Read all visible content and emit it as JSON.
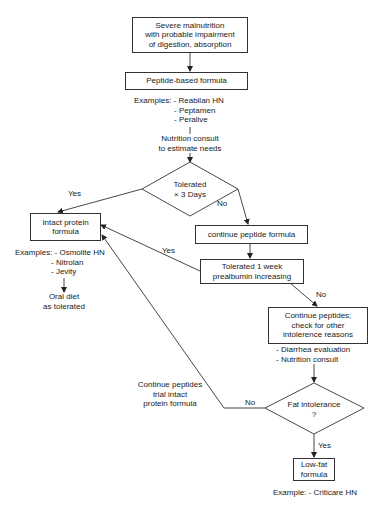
{
  "diagram": {
    "type": "flowchart",
    "nodes": {
      "start": {
        "lines": [
          "Severe malnutrition",
          "with probable impairment",
          "of digestion, absorption"
        ]
      },
      "peptide_formula": {
        "label": "Peptide-based formula"
      },
      "peptide_examples": {
        "lines": [
          "Examples: - Reabilan HN",
          "- Peptamen",
          "- Peralive"
        ]
      },
      "nutrition_consult": {
        "lines": [
          "Nutrition consult",
          "to estimate needs"
        ]
      },
      "decision_tolerated_3days": {
        "lines": [
          "Tolerated",
          "× 3 Days"
        ]
      },
      "intact_protein": {
        "lines": [
          "Intact protein",
          "formula"
        ]
      },
      "intact_examples": {
        "lines": [
          "Examples: - Osmolite HN",
          "- Nitrolan",
          "- Jevity"
        ]
      },
      "oral_diet": {
        "lines": [
          "Oral diet",
          "as tolerated"
        ]
      },
      "continue_peptide": {
        "label": "continue peptide formula"
      },
      "tolerated_1week": {
        "lines": [
          "Tolerated 1 week",
          "prealbumin increasing"
        ]
      },
      "continue_peptides_check": {
        "lines": [
          "Continue peptides;",
          "check for other",
          "intolerence reasons"
        ]
      },
      "check_items": {
        "lines": [
          "- Diarrhea evaluation",
          "- Nutrition consult"
        ]
      },
      "decision_fat": {
        "lines": [
          "Fat intolerance",
          "?"
        ]
      },
      "low_fat": {
        "lines": [
          "Low-fat",
          "formula"
        ]
      },
      "low_fat_example": {
        "label": "Example: - Criticare HN"
      },
      "trial_intact_note": {
        "lines": [
          "Continue peptides",
          "trial intact",
          "protein formula"
        ]
      }
    },
    "edge_labels": {
      "tolerated3_yes": "Yes",
      "tolerated3_no": "No",
      "week_yes": "Yes",
      "week_no": "No",
      "fat_no": "No",
      "fat_yes": "Yes"
    },
    "colors": {
      "line": "#333333",
      "background": "#ffffff",
      "text": "#1a1a1a"
    }
  }
}
